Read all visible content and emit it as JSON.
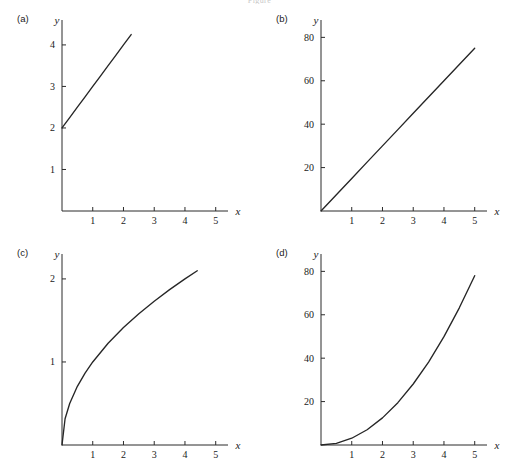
{
  "figure": {
    "caption_top": "Figure",
    "caption_bottom": "",
    "background_color": "#ffffff",
    "line_color": "#262626",
    "axis_color": "#2b2b2b"
  },
  "panels": [
    {
      "key": "a",
      "label": "(a)"
    },
    {
      "key": "b",
      "label": "(b)"
    },
    {
      "key": "c",
      "label": "(c)"
    },
    {
      "key": "d",
      "label": "(d)"
    }
  ],
  "axis_titles": {
    "x": "x",
    "y": "y"
  },
  "chart_data": [
    {
      "type": "line",
      "panel": "(a)",
      "title": "",
      "xlabel": "x",
      "ylabel": "y",
      "xlim": [
        0,
        5.4
      ],
      "ylim": [
        0,
        4.6
      ],
      "xticks": [
        1,
        2,
        3,
        4,
        5
      ],
      "yticks": [
        1,
        2,
        3,
        4
      ],
      "xticklabels": [
        "1",
        "2",
        "3",
        "4",
        "5"
      ],
      "yticklabels": [
        "1",
        "2",
        "3",
        "4"
      ],
      "grid": false,
      "legend": false,
      "equation": "y = x + 2",
      "x": [
        0,
        0.25,
        0.5,
        0.75,
        1,
        1.25,
        1.5,
        1.75,
        2,
        2.25
      ],
      "values": [
        2,
        2.25,
        2.5,
        2.75,
        3,
        3.25,
        3.5,
        3.75,
        4,
        4.25
      ]
    },
    {
      "type": "line",
      "panel": "(b)",
      "title": "",
      "xlabel": "x",
      "ylabel": "y",
      "xlim": [
        0,
        5.4
      ],
      "ylim": [
        0,
        88
      ],
      "xticks": [
        1,
        2,
        3,
        4,
        5
      ],
      "yticks": [
        20,
        40,
        60,
        80
      ],
      "xticklabels": [
        "1",
        "2",
        "3",
        "4",
        "5"
      ],
      "yticklabels": [
        "20",
        "40",
        "60",
        "80"
      ],
      "grid": false,
      "legend": false,
      "equation": "y = 15x",
      "x": [
        0,
        0.5,
        1,
        1.5,
        2,
        2.5,
        3,
        3.5,
        4,
        4.5,
        5
      ],
      "values": [
        0,
        7.5,
        15,
        22.5,
        30,
        37.5,
        45,
        52.5,
        60,
        67.5,
        75
      ]
    },
    {
      "type": "line",
      "panel": "(c)",
      "title": "",
      "xlabel": "x",
      "ylabel": "y",
      "xlim": [
        0,
        5.4
      ],
      "ylim": [
        0,
        2.3
      ],
      "xticks": [
        1,
        2,
        3,
        4,
        5
      ],
      "yticks": [
        1,
        2
      ],
      "xticklabels": [
        "1",
        "2",
        "3",
        "4",
        "5"
      ],
      "yticklabels": [
        "1",
        "2"
      ],
      "grid": false,
      "legend": false,
      "equation": "y = sqrt(x)",
      "x": [
        0,
        0.1,
        0.25,
        0.5,
        0.75,
        1,
        1.5,
        2,
        2.5,
        3,
        3.5,
        4,
        4.4
      ],
      "values": [
        0,
        0.316,
        0.5,
        0.707,
        0.866,
        1,
        1.225,
        1.414,
        1.581,
        1.732,
        1.871,
        2,
        2.098
      ]
    },
    {
      "type": "line",
      "panel": "(d)",
      "title": "",
      "xlabel": "x",
      "ylabel": "y",
      "xlim": [
        0,
        5.4
      ],
      "ylim": [
        0,
        88
      ],
      "xticks": [
        1,
        2,
        3,
        4,
        5
      ],
      "yticks": [
        20,
        40,
        60,
        80
      ],
      "xticklabels": [
        "1",
        "2",
        "3",
        "4",
        "5"
      ],
      "yticklabels": [
        "20",
        "40",
        "60",
        "80"
      ],
      "grid": false,
      "legend": false,
      "equation": "y = 3.12x^2",
      "x": [
        0,
        0.5,
        1,
        1.5,
        2,
        2.5,
        3,
        3.5,
        4,
        4.5,
        5
      ],
      "values": [
        0,
        0.78,
        3.12,
        7.02,
        12.5,
        19.5,
        28.1,
        38.2,
        49.9,
        63.2,
        78
      ]
    }
  ]
}
